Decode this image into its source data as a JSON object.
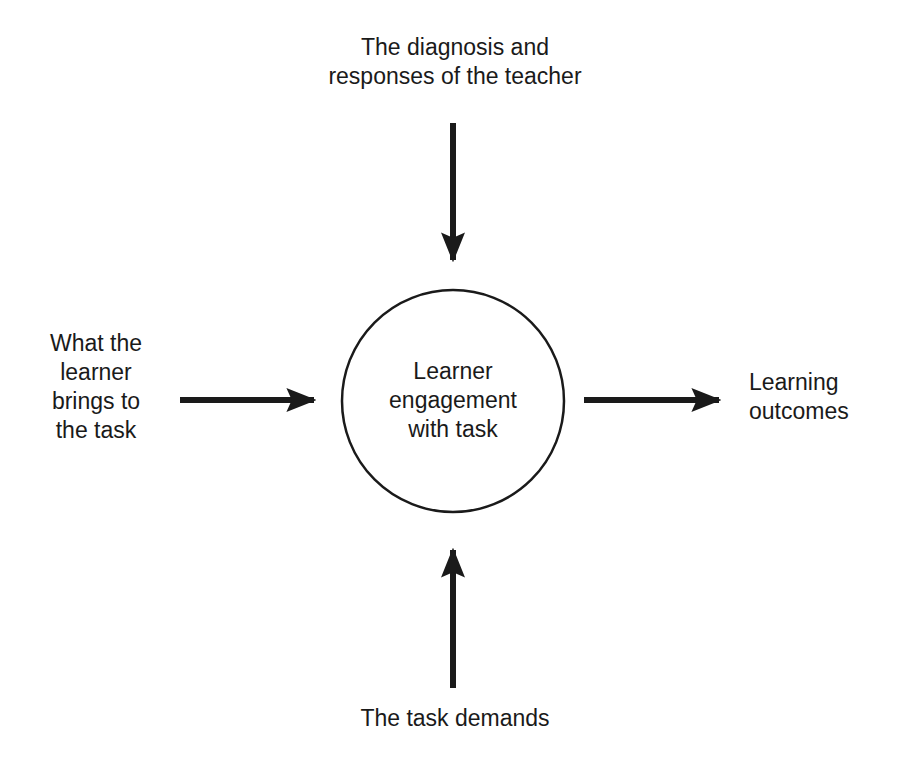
{
  "diagram": {
    "type": "flow",
    "center": {
      "lines": [
        "Learner",
        "engagement",
        "with task"
      ],
      "shape": "circle",
      "cx": 453,
      "cy": 401,
      "r": 111
    },
    "inputs": [
      {
        "position": "top",
        "lines": [
          "The diagnosis and",
          "responses of the teacher"
        ],
        "arrow_direction": "down",
        "arrow": {
          "x1": 453,
          "y1": 123,
          "x2": 453,
          "y2": 274
        }
      },
      {
        "position": "left",
        "lines": [
          "What the",
          "learner",
          "brings to",
          "the task"
        ],
        "arrow_direction": "right",
        "arrow": {
          "x1": 180,
          "y1": 400,
          "x2": 328,
          "y2": 400
        }
      },
      {
        "position": "bottom",
        "lines": [
          "The task demands"
        ],
        "arrow_direction": "up",
        "arrow": {
          "x1": 453,
          "y1": 688,
          "x2": 453,
          "y2": 536
        }
      }
    ],
    "outputs": [
      {
        "position": "right",
        "lines": [
          "Learning",
          "outcomes"
        ],
        "arrow_direction": "right",
        "arrow": {
          "x1": 584,
          "y1": 400,
          "x2": 733,
          "y2": 400
        }
      }
    ],
    "colors": {
      "stroke": "#1a1a1a",
      "text": "#1a1a1a",
      "background": "#ffffff"
    }
  }
}
